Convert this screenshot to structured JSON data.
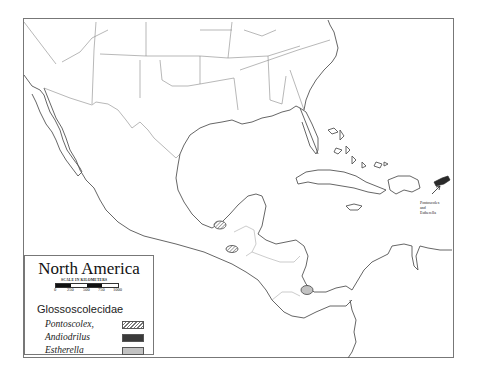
{
  "map": {
    "region": "North America",
    "frame": {
      "border_color": "#777777"
    },
    "annotation": {
      "line1": "Pontoscolex",
      "line2": "and",
      "line3": "Estherella"
    }
  },
  "legend": {
    "title": "North America",
    "scale_caption": "SCALE IN KILOMETERS",
    "scale_ticks": [
      "0",
      "250",
      "500",
      "750",
      "1000"
    ],
    "family": "Glossoscolecidae",
    "items": [
      {
        "label": "Pontoscolex,",
        "pattern": "hatched",
        "color": "#777777"
      },
      {
        "label": "Andiodrilus",
        "pattern": "solid",
        "color": "#3a3a3a"
      },
      {
        "label": "Estherella",
        "pattern": "solid",
        "color": "#c2c2c2"
      }
    ]
  }
}
